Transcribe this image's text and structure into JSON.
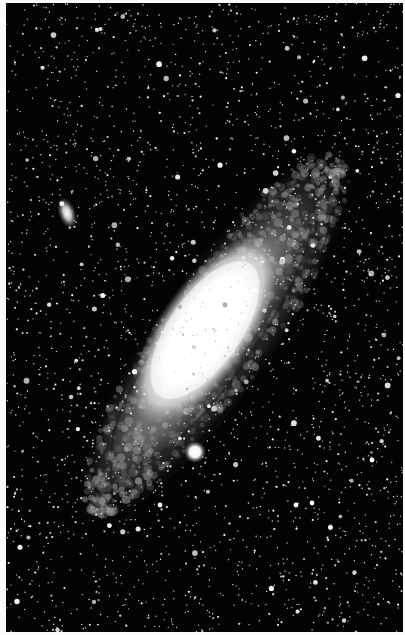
{
  "image": {
    "subject": "Andromeda Galaxy (M31) with satellite galaxies",
    "style": "monochrome astrophotograph",
    "width": 405,
    "height": 635,
    "border_color": "#fbfbfb",
    "sky_color": "#030303"
  },
  "objects": [
    {
      "name": "andromeda-galaxy",
      "cx": 215,
      "cy": 335,
      "length": 420,
      "width": 120,
      "angle_deg": -55
    },
    {
      "name": "galaxy-core",
      "cx": 205,
      "cy": 330,
      "length": 160,
      "width": 70,
      "angle_deg": -55
    },
    {
      "name": "satellite-galaxy-m110",
      "cx": 67,
      "cy": 213,
      "rx": 9,
      "ry": 17,
      "angle_deg": -20
    },
    {
      "name": "satellite-galaxy-m32",
      "cx": 195,
      "cy": 452,
      "r": 8
    }
  ],
  "starfield": {
    "count": 2600,
    "seed": 31
  }
}
